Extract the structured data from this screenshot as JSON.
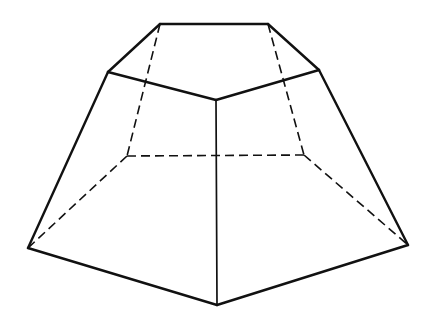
{
  "diagram": {
    "title": "",
    "background": "#ffffff",
    "stroke_color": "#111111",
    "visible_stroke_width": 2.4,
    "center_stroke_width": 1.7,
    "hidden_stroke_width": 1.6,
    "hidden_dash": "9 5",
    "vertices": {
      "top_back_left": [
        160,
        24
      ],
      "top_back_right": [
        268,
        24
      ],
      "top_left": [
        108,
        72
      ],
      "top_right": [
        319,
        70
      ],
      "top_front": [
        216,
        100
      ],
      "bottom_back_left": [
        127,
        156
      ],
      "bottom_back_right": [
        304,
        155
      ],
      "bottom_left": [
        28,
        248
      ],
      "bottom_right": [
        408,
        245
      ],
      "bottom_front": [
        217,
        305
      ]
    },
    "visible_edges": [
      [
        "top_back_left",
        "top_back_right"
      ],
      [
        "top_back_left",
        "top_left"
      ],
      [
        "top_back_right",
        "top_right"
      ],
      [
        "top_left",
        "top_front"
      ],
      [
        "top_right",
        "top_front"
      ],
      [
        "top_left",
        "bottom_left"
      ],
      [
        "top_right",
        "bottom_right"
      ],
      [
        "bottom_left",
        "bottom_front"
      ],
      [
        "bottom_right",
        "bottom_front"
      ]
    ],
    "center_edges": [
      [
        "top_front",
        "bottom_front"
      ]
    ],
    "hidden_edges": [
      [
        "top_back_left",
        "bottom_back_left"
      ],
      [
        "top_back_right",
        "bottom_back_right"
      ],
      [
        "bottom_back_left",
        "bottom_back_right"
      ],
      [
        "bottom_back_left",
        "bottom_left"
      ],
      [
        "bottom_back_right",
        "bottom_right"
      ]
    ]
  }
}
